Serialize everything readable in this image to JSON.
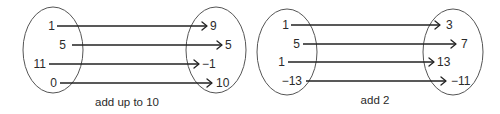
{
  "diagrams": [
    {
      "caption": "add up to 10",
      "caption_pos": [
        127,
        106
      ],
      "domain_ellipse": {
        "cx": 53,
        "cy": 50,
        "rx": 30,
        "ry": 43
      },
      "codomain_ellipse": {
        "cx": 216,
        "cy": 50,
        "rx": 30,
        "ry": 43
      },
      "mappings": [
        {
          "from": "1",
          "to": "9",
          "y": 26,
          "from_x": 55,
          "line_x1": 57,
          "line_x2": 207,
          "to_x": 210
        },
        {
          "from": "5",
          "to": "5",
          "y": 45,
          "from_x": 66,
          "line_x1": 72,
          "line_x2": 222,
          "to_x": 225
        },
        {
          "from": "11",
          "to": "−1",
          "y": 64,
          "from_x": 46,
          "line_x1": 49,
          "line_x2": 199,
          "to_x": 202
        },
        {
          "from": "0",
          "to": "10",
          "y": 83,
          "from_x": 57,
          "line_x1": 60,
          "line_x2": 212,
          "to_x": 216
        }
      ]
    },
    {
      "caption": "add 2",
      "caption_pos": [
        375,
        104
      ],
      "domain_ellipse": {
        "cx": 287,
        "cy": 52,
        "rx": 30,
        "ry": 43
      },
      "codomain_ellipse": {
        "cx": 453,
        "cy": 52,
        "rx": 30,
        "ry": 43
      },
      "mappings": [
        {
          "from": "1",
          "to": "3",
          "y": 25,
          "from_x": 289,
          "line_x1": 291,
          "line_x2": 440,
          "to_x": 446
        },
        {
          "from": "5",
          "to": "7",
          "y": 44,
          "from_x": 300,
          "line_x1": 303,
          "line_x2": 456,
          "to_x": 461
        },
        {
          "from": "1",
          "to": "13",
          "y": 62,
          "from_x": 285,
          "line_x1": 288,
          "line_x2": 434,
          "to_x": 437
        },
        {
          "from": "−13",
          "to": "−11",
          "y": 81,
          "from_x": 302,
          "line_x1": 306,
          "line_x2": 446,
          "to_x": 451
        }
      ]
    }
  ]
}
